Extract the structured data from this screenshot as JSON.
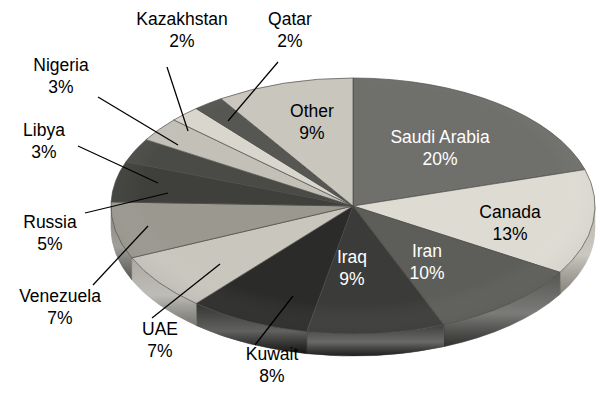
{
  "chart_data": {
    "type": "pie",
    "title": "",
    "subtitle": "",
    "xlabel": "",
    "ylabel": "",
    "legend_position": "none",
    "grid": false,
    "style": "3d-grayscale-ellipse",
    "unit": "%",
    "categories": [
      "Saudi Arabia",
      "Canada",
      "Iran",
      "Iraq",
      "Kuwait",
      "UAE",
      "Venezuela",
      "Russia",
      "Libya",
      "Nigeria",
      "Kazakhstan",
      "Qatar",
      "Other"
    ],
    "values": [
      20,
      13,
      10,
      9,
      8,
      7,
      7,
      5,
      3,
      3,
      2,
      2,
      9
    ],
    "slices": [
      {
        "name": "Saudi Arabia",
        "label": "Saudi Arabia",
        "percent_text": "20%",
        "value": 20,
        "color": "#6f6f6c",
        "side_color": "#55554f",
        "label_placement": "inside",
        "label_color": "#ffffff",
        "label_x": 440,
        "label_y": 138,
        "pct_x": 440,
        "pct_y": 160
      },
      {
        "name": "Canada",
        "label": "Canada",
        "percent_text": "13%",
        "value": 13,
        "color": "#dedbd3",
        "side_color": "#b4b0a6",
        "label_placement": "inside",
        "label_color": "#000000",
        "label_x": 510,
        "label_y": 213,
        "pct_x": 510,
        "pct_y": 235
      },
      {
        "name": "Iran",
        "label": "Iran",
        "percent_text": "10%",
        "value": 10,
        "color": "#5d5d59",
        "side_color": "#434340",
        "label_placement": "inside",
        "label_color": "#ffffff",
        "label_x": 427,
        "label_y": 252,
        "pct_x": 427,
        "pct_y": 274
      },
      {
        "name": "Iraq",
        "label": "Iraq",
        "percent_text": "9%",
        "value": 9,
        "color": "#3b3b39",
        "side_color": "#2a2a28",
        "label_placement": "inside",
        "label_color": "#ffffff",
        "label_x": 352,
        "label_y": 258,
        "pct_x": 352,
        "pct_y": 280
      },
      {
        "name": "Kuwait",
        "label": "Kuwait",
        "percent_text": "8%",
        "value": 8,
        "color": "#2b2b29",
        "side_color": "#1e1e1c",
        "label_placement": "outside",
        "label_color": "#000000",
        "label_x": 272,
        "label_y": 355,
        "pct_x": 272,
        "pct_y": 377,
        "leader": [
          255,
          345,
          293,
          296
        ]
      },
      {
        "name": "UAE",
        "label": "UAE",
        "percent_text": "7%",
        "value": 7,
        "color": "#c9c6be",
        "side_color": "#a3a098",
        "label_placement": "outside",
        "label_color": "#000000",
        "label_x": 160,
        "label_y": 330,
        "pct_x": 160,
        "pct_y": 352,
        "leader": [
          152,
          318,
          220,
          264
        ]
      },
      {
        "name": "Venezuela",
        "label": "Venezuela",
        "percent_text": "7%",
        "value": 7,
        "color": "#9a988f",
        "side_color": "#78766f",
        "label_placement": "outside",
        "label_color": "#000000",
        "label_x": 60,
        "label_y": 297,
        "pct_x": 60,
        "pct_y": 319,
        "leader": [
          93,
          285,
          148,
          226
        ]
      },
      {
        "name": "Russia",
        "label": "Russia",
        "percent_text": "5%",
        "value": 5,
        "color": "#3f3f3c",
        "side_color": "#2d2d2b",
        "label_placement": "outside",
        "label_color": "#000000",
        "label_x": 50,
        "label_y": 223,
        "pct_x": 50,
        "pct_y": 245
      },
      {
        "name": "Libya",
        "label": "Libya",
        "percent_text": "3%",
        "value": 3,
        "color": "#4a4a46",
        "side_color": "#343431",
        "label_placement": "outside",
        "label_color": "#000000",
        "label_x": 44,
        "label_y": 131,
        "pct_x": 44,
        "pct_y": 153,
        "leader": [
          78,
          146,
          158,
          183
        ]
      },
      {
        "name": "Nigeria",
        "label": "Nigeria",
        "percent_text": "3%",
        "value": 3,
        "color": "#c3c0b7",
        "side_color": "#9c998f",
        "label_placement": "outside",
        "label_color": "#000000",
        "label_x": 61,
        "label_y": 66,
        "pct_x": 61,
        "pct_y": 88,
        "leader": [
          98,
          97,
          178,
          145
        ]
      },
      {
        "name": "Kazakhstan",
        "label": "Kazakhstan",
        "percent_text": "2%",
        "value": 2,
        "color": "#d9d6cd",
        "side_color": "#aeab a3",
        "label_placement": "outside",
        "label_color": "#000000",
        "label_x": 182,
        "label_y": 20,
        "pct_x": 182,
        "pct_y": 42,
        "leader": [
          167,
          67,
          188,
          131
        ]
      },
      {
        "name": "Qatar",
        "label": "Qatar",
        "percent_text": "2%",
        "value": 2,
        "color": "#565652",
        "side_color": "#3d3d3a",
        "label_placement": "outside",
        "label_color": "#000000",
        "label_x": 290,
        "label_y": 20,
        "pct_x": 290,
        "pct_y": 42,
        "leader": [
          278,
          62,
          228,
          121
        ]
      },
      {
        "name": "Other",
        "label": "Other",
        "percent_text": "9%",
        "value": 9,
        "color": "#c9c6bd",
        "side_color": "#a2a096",
        "label_placement": "inside",
        "label_color": "#000000",
        "label_x": 312,
        "label_y": 112,
        "pct_x": 312,
        "pct_y": 134
      }
    ],
    "geometry": {
      "center_x": 353,
      "center_y": 206,
      "radius_x": 242,
      "radius_y": 128,
      "depth": 22,
      "start_angle_deg": -90,
      "direction": "clockwise"
    },
    "background_color": "#ffffff"
  }
}
